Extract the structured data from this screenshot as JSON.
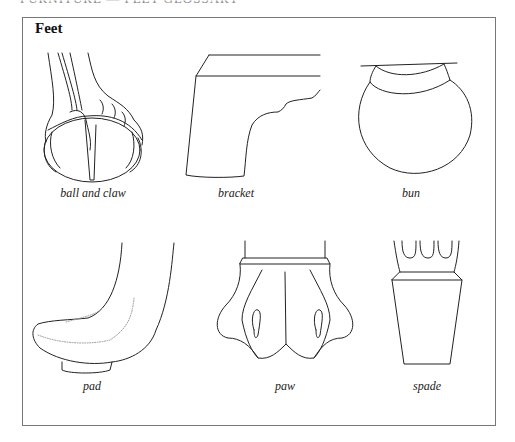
{
  "page": {
    "clipped_header": "FURNITURE — FEET GLOSSARY",
    "section_title": "Feet"
  },
  "illustrations": [
    {
      "id": "ball-and-claw",
      "caption": "ball and claw"
    },
    {
      "id": "bracket",
      "caption": "bracket"
    },
    {
      "id": "bun",
      "caption": "bun"
    },
    {
      "id": "pad",
      "caption": "pad"
    },
    {
      "id": "paw",
      "caption": "paw"
    },
    {
      "id": "spade",
      "caption": "spade"
    }
  ],
  "colors": {
    "ink": "#222222",
    "frame": "#777777",
    "background": "#ffffff"
  }
}
